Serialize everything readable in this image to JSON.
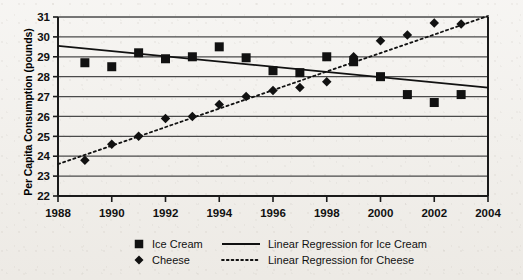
{
  "chart_data": {
    "type": "scatter",
    "title": "",
    "xlabel": "",
    "ylabel": "Per Capita Consumption (pounds)",
    "xlim": [
      1988,
      2004
    ],
    "ylim": [
      22,
      31
    ],
    "grid": true,
    "xticks": [
      "1988",
      "1990",
      "1992",
      "1994",
      "1996",
      "1998",
      "2000",
      "2002",
      "2004"
    ],
    "yticks": [
      "22",
      "23",
      "24",
      "25",
      "26",
      "27",
      "28",
      "29",
      "30",
      "31"
    ],
    "x": [
      1989,
      1990,
      1991,
      1992,
      1993,
      1994,
      1995,
      1996,
      1997,
      1998,
      1999,
      2000,
      2001,
      2002,
      2003
    ],
    "series": [
      {
        "name": "Ice Cream",
        "marker": "square",
        "values": [
          28.7,
          28.5,
          29.2,
          28.9,
          29.0,
          29.5,
          28.95,
          28.3,
          28.2,
          29.0,
          28.75,
          28.0,
          27.1,
          26.7,
          27.1
        ]
      },
      {
        "name": "Cheese",
        "marker": "diamond",
        "values": [
          23.8,
          24.6,
          25.0,
          25.9,
          26.0,
          26.6,
          27.0,
          27.3,
          27.45,
          27.75,
          29.0,
          29.8,
          30.1,
          30.7,
          30.65
        ]
      }
    ],
    "trendlines": [
      {
        "name": "Linear Regression for Ice Cream",
        "style": "solid",
        "x_start": 1988,
        "y_start": 29.55,
        "x_end": 2004,
        "y_end": 27.45
      },
      {
        "name": "Linear Regression for Cheese",
        "style": "dotted",
        "x_start": 1988,
        "y_start": 23.6,
        "x_end": 2004,
        "y_end": 31.05
      }
    ],
    "legend": {
      "position": "bottom",
      "entries": [
        {
          "label": "Ice Cream",
          "marker": "square"
        },
        {
          "label": "Cheese",
          "marker": "diamond"
        },
        {
          "label": "Linear Regression for Ice Cream",
          "marker": "solid-line"
        },
        {
          "label": "Linear Regression for Cheese",
          "marker": "dotted-line"
        }
      ]
    },
    "colors": {
      "series": "#111111",
      "grid": "#4a4a4a",
      "axis": "#1a1a1a",
      "background": "#f2f0ec"
    }
  }
}
